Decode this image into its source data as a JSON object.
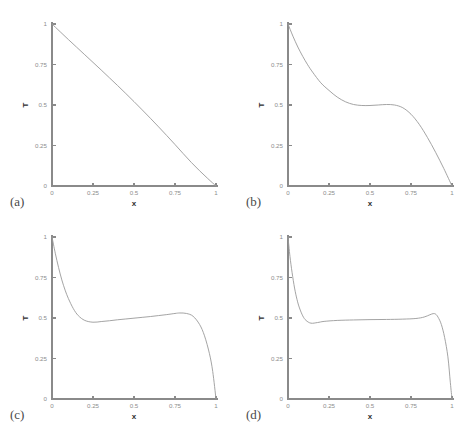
{
  "figure": {
    "background_color": "#ffffff",
    "curve_color": "#9a9a9a",
    "axis_color": "#8a8a8a",
    "label_color": "#2e2e2e",
    "panel_count": 4
  },
  "chart_data": [
    {
      "type": "line",
      "panel_label": "(a)",
      "title": "",
      "xlabel": "x",
      "ylabel": "T",
      "xlim": [
        0,
        1
      ],
      "ylim": [
        0,
        1
      ],
      "xticks": [
        0,
        0.25,
        0.5,
        0.75,
        1
      ],
      "xticklabels": [
        "0",
        "0.25",
        "0.5",
        "0.75",
        "1"
      ],
      "yticks": [
        0,
        0.25,
        0.5,
        0.75,
        1
      ],
      "yticklabels": [
        "0",
        "0.25",
        "0.5",
        "0.75",
        "1"
      ],
      "grid": false,
      "legend": false,
      "series": [
        {
          "name": "T(x)",
          "x": [
            0,
            0.05,
            0.1,
            0.15,
            0.2,
            0.25,
            0.3,
            0.35,
            0.4,
            0.45,
            0.5,
            0.55,
            0.6,
            0.65,
            0.7,
            0.75,
            0.8,
            0.85,
            0.9,
            0.95,
            1
          ],
          "values": [
            1.0,
            0.952,
            0.904,
            0.857,
            0.81,
            0.763,
            0.716,
            0.668,
            0.62,
            0.571,
            0.521,
            0.47,
            0.418,
            0.365,
            0.311,
            0.256,
            0.2,
            0.145,
            0.094,
            0.046,
            0.0
          ]
        }
      ]
    },
    {
      "type": "line",
      "panel_label": "(b)",
      "title": "",
      "xlabel": "x",
      "ylabel": "T",
      "xlim": [
        0,
        1
      ],
      "ylim": [
        0,
        1
      ],
      "xticks": [
        0,
        0.25,
        0.5,
        0.75,
        1
      ],
      "xticklabels": [
        "0",
        "0.25",
        "0.5",
        "0.75",
        "1"
      ],
      "yticks": [
        0,
        0.25,
        0.5,
        0.75,
        1
      ],
      "yticklabels": [
        "0",
        "0.25",
        "0.5",
        "0.75",
        "1"
      ],
      "grid": false,
      "legend": false,
      "series": [
        {
          "name": "T(x)",
          "x": [
            0,
            0.03,
            0.06,
            0.09,
            0.12,
            0.15,
            0.2,
            0.25,
            0.3,
            0.35,
            0.4,
            0.45,
            0.5,
            0.55,
            0.6,
            0.65,
            0.7,
            0.75,
            0.8,
            0.85,
            0.9,
            0.95,
            1
          ],
          "values": [
            1.0,
            0.925,
            0.858,
            0.8,
            0.748,
            0.703,
            0.637,
            0.59,
            0.549,
            0.52,
            0.503,
            0.497,
            0.497,
            0.5,
            0.503,
            0.5,
            0.483,
            0.443,
            0.381,
            0.3,
            0.208,
            0.108,
            0.0
          ]
        }
      ]
    },
    {
      "type": "line",
      "panel_label": "(c)",
      "title": "",
      "xlabel": "x",
      "ylabel": "T",
      "xlim": [
        0,
        1
      ],
      "ylim": [
        0,
        1
      ],
      "xticks": [
        0,
        0.25,
        0.5,
        0.75,
        1
      ],
      "xticklabels": [
        "0",
        "0.25",
        "0.5",
        "0.75",
        "1"
      ],
      "yticks": [
        0,
        0.25,
        0.5,
        0.75,
        1
      ],
      "yticklabels": [
        "0",
        "0.25",
        "0.5",
        "0.75",
        "1"
      ],
      "grid": false,
      "legend": false,
      "series": [
        {
          "name": "T(x)",
          "x": [
            0,
            0.02,
            0.04,
            0.06,
            0.08,
            0.1,
            0.13,
            0.16,
            0.2,
            0.25,
            0.3,
            0.35,
            0.4,
            0.45,
            0.5,
            0.55,
            0.6,
            0.65,
            0.7,
            0.75,
            0.78,
            0.82,
            0.86,
            0.9,
            0.93,
            0.96,
            0.98,
            1
          ],
          "values": [
            1.0,
            0.9,
            0.812,
            0.735,
            0.672,
            0.62,
            0.558,
            0.515,
            0.485,
            0.474,
            0.478,
            0.483,
            0.489,
            0.494,
            0.499,
            0.504,
            0.509,
            0.515,
            0.521,
            0.528,
            0.531,
            0.528,
            0.511,
            0.46,
            0.39,
            0.28,
            0.17,
            0.0
          ]
        }
      ]
    },
    {
      "type": "line",
      "panel_label": "(d)",
      "title": "",
      "xlabel": "x",
      "ylabel": "T",
      "xlim": [
        0,
        1
      ],
      "ylim": [
        0,
        1
      ],
      "xticks": [
        0,
        0.25,
        0.5,
        0.75,
        1
      ],
      "xticklabels": [
        "0",
        "0.25",
        "0.5",
        "0.75",
        "1"
      ],
      "yticks": [
        0,
        0.25,
        0.5,
        0.75,
        1
      ],
      "yticklabels": [
        "0",
        "0.25",
        "0.5",
        "0.75",
        "1"
      ],
      "grid": false,
      "legend": false,
      "series": [
        {
          "name": "T(x)",
          "x": [
            0,
            0.012,
            0.025,
            0.04,
            0.055,
            0.07,
            0.09,
            0.11,
            0.14,
            0.18,
            0.22,
            0.3,
            0.4,
            0.5,
            0.6,
            0.7,
            0.78,
            0.83,
            0.865,
            0.885,
            0.9,
            0.915,
            0.935,
            0.955,
            0.975,
            0.99,
            1
          ],
          "values": [
            1.0,
            0.88,
            0.78,
            0.685,
            0.614,
            0.562,
            0.513,
            0.485,
            0.468,
            0.472,
            0.479,
            0.485,
            0.488,
            0.49,
            0.491,
            0.493,
            0.497,
            0.506,
            0.52,
            0.527,
            0.524,
            0.505,
            0.46,
            0.38,
            0.26,
            0.1,
            0.0
          ]
        }
      ]
    }
  ]
}
